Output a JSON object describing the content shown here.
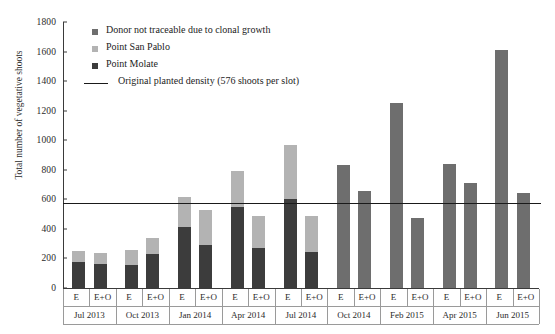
{
  "chart_data": {
    "type": "bar",
    "title": "",
    "subtitle": "",
    "xlabel": "",
    "ylabel": "Total number of vegetative shoots",
    "ylim": [
      0,
      1800
    ],
    "ytick_step": 200,
    "yticks": [
      "1800",
      "1600",
      "1400",
      "1200",
      "1000",
      "800",
      "600",
      "400",
      "200",
      "0"
    ],
    "grid": false,
    "stacked": true,
    "legend_position": "top-left-inside",
    "categories": [
      "Jul 2013 E",
      "Jul 2013 E+O",
      "Oct 2013 E",
      "Oct 2013 E+O",
      "Jan 2014 E",
      "Jan 2014 E+O",
      "Apr 2014 E",
      "Apr 2014 E+O",
      "Jul 2014 E",
      "Jul 2014 E+O",
      "Oct 2014 E",
      "Oct 2014 E+O",
      "Feb 2015 E",
      "Feb 2015 E+O",
      "Apr 2015 E",
      "Apr 2015 E+O",
      "Jun 2015 E",
      "Jun 2015 E+O"
    ],
    "groups": [
      {
        "date": "Jul 2013",
        "bars": [
          "E",
          "E+O"
        ]
      },
      {
        "date": "Oct 2013",
        "bars": [
          "E",
          "E+O"
        ]
      },
      {
        "date": "Jan 2014",
        "bars": [
          "E",
          "E+O"
        ]
      },
      {
        "date": "Apr 2014",
        "bars": [
          "E",
          "E+O"
        ]
      },
      {
        "date": "Jul 2014",
        "bars": [
          "E",
          "E+O"
        ]
      },
      {
        "date": "Oct 2014",
        "bars": [
          "E",
          "E+O"
        ]
      },
      {
        "date": "Feb 2015",
        "bars": [
          "E",
          "E+O"
        ]
      },
      {
        "date": "Apr 2015",
        "bars": [
          "E",
          "E+O"
        ]
      },
      {
        "date": "Jun 2015",
        "bars": [
          "E",
          "E+O"
        ]
      }
    ],
    "series": [
      {
        "name": "Point Molate",
        "color": "#3c3c3c",
        "values": [
          175,
          160,
          155,
          230,
          410,
          290,
          550,
          270,
          600,
          245,
          0,
          0,
          0,
          0,
          0,
          0,
          0,
          0
        ]
      },
      {
        "name": "Point San Pablo",
        "color": "#b3b3b3",
        "values": [
          75,
          75,
          100,
          110,
          205,
          240,
          245,
          215,
          365,
          240,
          0,
          0,
          0,
          0,
          0,
          0,
          0,
          0
        ]
      },
      {
        "name": "Donor not traceable due to clonal growth",
        "color": "#6e6e6e",
        "values": [
          0,
          0,
          0,
          0,
          0,
          0,
          0,
          0,
          0,
          0,
          835,
          655,
          1250,
          475,
          840,
          710,
          1610,
          640
        ]
      }
    ],
    "totals": [
      250,
      235,
      255,
      340,
      615,
      530,
      795,
      485,
      965,
      485,
      835,
      655,
      1250,
      475,
      840,
      710,
      1610,
      640
    ],
    "reference_line": {
      "label": "Original planted density (576 shoots per slot)",
      "value": 576,
      "color": "#1a1a1a"
    }
  },
  "legend": {
    "items": [
      {
        "label": "Donor not traceable due to clonal growth",
        "color": "#6e6e6e",
        "marker": "square"
      },
      {
        "label": "Point San Pablo",
        "color": "#b3b3b3",
        "marker": "square"
      },
      {
        "label": "Point Molate",
        "color": "#3c3c3c",
        "marker": "square"
      },
      {
        "label": "Original planted density (576 shoots per slot)",
        "color": "#1a1a1a",
        "marker": "line"
      }
    ]
  }
}
